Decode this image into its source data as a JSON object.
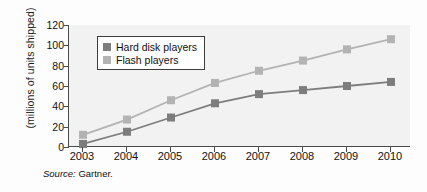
{
  "chart_data": {
    "type": "line",
    "title": "",
    "xlabel": "",
    "ylabel": "(millions of units shipped)",
    "categories": [
      "2003",
      "2004",
      "2005",
      "2006",
      "2007",
      "2008",
      "2009",
      "2010"
    ],
    "x": [
      2003,
      2004,
      2005,
      2006,
      2007,
      2008,
      2009,
      2010
    ],
    "ylim": [
      0,
      120
    ],
    "yticks": [
      0,
      20,
      40,
      60,
      80,
      100,
      120
    ],
    "grid": false,
    "legend_position": "top-left-inside",
    "marker": "square",
    "series": [
      {
        "name": "Hard disk players",
        "color": "#7d7d7d",
        "values": [
          3,
          15,
          29,
          43,
          52,
          56,
          60,
          64
        ]
      },
      {
        "name": "Flash players",
        "color": "#b3b3b3",
        "values": [
          12,
          27,
          46,
          63,
          75,
          85,
          96,
          106
        ]
      }
    ],
    "annotations": [
      "Source: Gartner."
    ]
  },
  "axis": {
    "y_title": "(millions of units shipped)",
    "y_tick_labels": [
      "120",
      "100",
      "80",
      "60",
      "40",
      "20",
      "0"
    ],
    "x_tick_labels": [
      "2003",
      "2004",
      "2005",
      "2006",
      "2007",
      "2008",
      "2009",
      "2010"
    ]
  },
  "legend": {
    "items": [
      {
        "label": "Hard disk players",
        "color": "#7d7d7d"
      },
      {
        "label": "Flash players",
        "color": "#b3b3b3"
      }
    ]
  },
  "source": {
    "prefix": "Source:",
    "text": "Gartner."
  },
  "colors": {
    "hard_disk": "#7d7d7d",
    "flash": "#b3b3b3",
    "axis": "#4a4a4a",
    "plot_background": "#f2f2f2",
    "page_background": "#fdfdfd"
  }
}
